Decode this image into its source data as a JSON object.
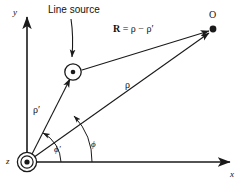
{
  "figure": {
    "kind": "vector-geometry-diagram",
    "background_color": "#ffffff",
    "stroke_color": "#1a1a1a",
    "axes": {
      "x_label": "x",
      "y_label": "y",
      "z_label": "z"
    },
    "annotations": {
      "line_source_label": "Line source",
      "observation_point_label": "O",
      "vector_R_prefix": "R",
      "vector_R_equation": " = ρ − ρ′",
      "vector_rho_label": "ρ",
      "vector_rho_prime_label": "ρ′",
      "angle_phi_label": "ϕ",
      "angle_phi_prime_label": "ϕ′"
    },
    "geometry": {
      "origin": [
        27,
        162
      ],
      "line_source_point": [
        73,
        72
      ],
      "observation_point": [
        212,
        30
      ],
      "x_axis_end": [
        233,
        162
      ],
      "y_axis_top": [
        27,
        14
      ]
    }
  }
}
